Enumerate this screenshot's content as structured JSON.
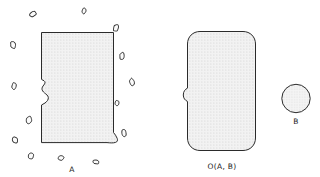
{
  "figure": {
    "background_color": "#ffffff",
    "stroke_color": "#2b2b2b",
    "fill_color": "#ececec",
    "texture": "stipple-dots",
    "width": 320,
    "height": 177
  },
  "labels": {
    "set_a": "A",
    "opening": "O(A, B)",
    "structuring_element": "B"
  },
  "shapes": {
    "set_a": {
      "name": "noisy-rectangle-with-notch",
      "description": "rectangle with left-side concave notch, bottom-right spur, and scattered noise specks"
    },
    "opening": {
      "name": "rounded-rectangle-with-notch",
      "description": "smoothed rounded rectangle, noise specks removed by opening"
    },
    "structuring_element": {
      "name": "circle",
      "description": "circular structuring element B"
    }
  },
  "noise_specks": [
    {
      "cx": 33,
      "cy": 14,
      "rx": 4.0,
      "ry": 2.6,
      "rot": -28
    },
    {
      "cx": 84,
      "cy": 11,
      "rx": 2.1,
      "ry": 3.4,
      "rot": 8
    },
    {
      "cx": 116,
      "cy": 28,
      "rx": 2.8,
      "ry": 4.0,
      "rot": 22
    },
    {
      "cx": 13,
      "cy": 45,
      "rx": 2.8,
      "ry": 4.2,
      "rot": -16
    },
    {
      "cx": 122,
      "cy": 56,
      "rx": 2.6,
      "ry": 4.2,
      "rot": 10
    },
    {
      "cx": 14,
      "cy": 86,
      "rx": 2.4,
      "ry": 4.0,
      "rot": 6
    },
    {
      "cx": 132,
      "cy": 82,
      "rx": 2.6,
      "ry": 4.2,
      "rot": -12
    },
    {
      "cx": 117,
      "cy": 103,
      "rx": 2.2,
      "ry": 3.0,
      "rot": 4
    },
    {
      "cx": 29,
      "cy": 120,
      "rx": 3.0,
      "ry": 4.2,
      "rot": 14
    },
    {
      "cx": 124,
      "cy": 133,
      "rx": 2.4,
      "ry": 4.2,
      "rot": -10
    },
    {
      "cx": 15,
      "cy": 140,
      "rx": 2.8,
      "ry": 3.6,
      "rot": -30
    },
    {
      "cx": 31,
      "cy": 156,
      "rx": 3.0,
      "ry": 3.4,
      "rot": 18
    },
    {
      "cx": 61,
      "cy": 158,
      "rx": 3.2,
      "ry": 2.6,
      "rot": -8
    },
    {
      "cx": 96,
      "cy": 162,
      "rx": 3.6,
      "ry": 2.2,
      "rot": 12
    }
  ]
}
